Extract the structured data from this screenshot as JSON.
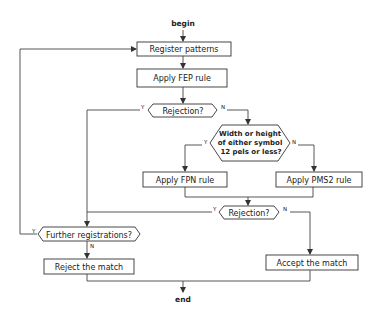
{
  "diagram": {
    "type": "flowchart",
    "start": "begin",
    "end": "end",
    "nodes": {
      "register": "Register patterns",
      "fep": "Apply FEP rule",
      "rejection1": "Rejection?",
      "size_check_lines": [
        "Width or height",
        "of either symbol",
        "12 pels or less?"
      ],
      "fpn": "Apply FPN rule",
      "pms2": "Apply PMS2 rule",
      "rejection2": "Rejection?",
      "further": "Further registrations?",
      "reject": "Reject the match",
      "accept": "Accept the match"
    },
    "branch_labels": {
      "yes": "Y",
      "no": "N"
    }
  }
}
